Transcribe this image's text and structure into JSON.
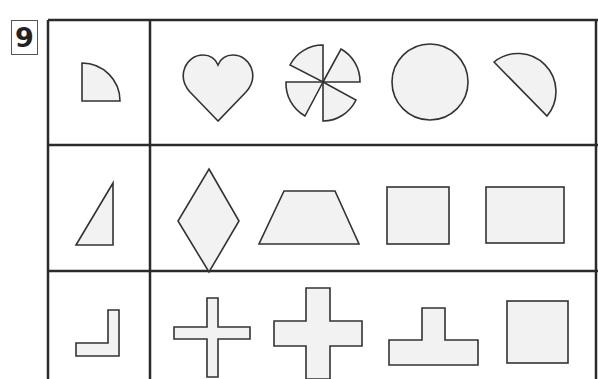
{
  "problem": {
    "number": "9"
  },
  "colors": {
    "line": "#2a2a2a",
    "shape_fill": "#f2f2f2",
    "shape_stroke": "#333333"
  },
  "rows": [
    {
      "reference": "quarter-circle",
      "options": [
        "heart",
        "pinwheel-four-quarter-sectors",
        "circle",
        "semicircle-tilted"
      ]
    },
    {
      "reference": "right-triangle",
      "options": [
        "rhombus",
        "trapezoid",
        "square",
        "rectangle"
      ]
    },
    {
      "reference": "l-shape",
      "options": [
        "thin-plus-cross",
        "thick-plus-cross",
        "t-shape-inverted",
        "square"
      ]
    }
  ]
}
